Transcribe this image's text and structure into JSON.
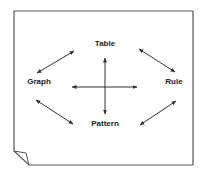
{
  "diagram": {
    "nodes": [
      {
        "id": "table",
        "label": "Table",
        "x": 105,
        "y": 44
      },
      {
        "id": "graph",
        "label": "Graph",
        "x": 39,
        "y": 82
      },
      {
        "id": "rule",
        "label": "Rule",
        "x": 174,
        "y": 82
      },
      {
        "id": "pattern",
        "label": "Pattern",
        "x": 105,
        "y": 124
      }
    ],
    "edges": [
      {
        "from": "graph",
        "to": "table",
        "type": "bidirectional"
      },
      {
        "from": "table",
        "to": "rule",
        "type": "bidirectional"
      },
      {
        "from": "graph",
        "to": "pattern",
        "type": "bidirectional"
      },
      {
        "from": "pattern",
        "to": "rule",
        "type": "bidirectional"
      },
      {
        "from": "table",
        "to": "pattern",
        "type": "bidirectional",
        "note": "vertical center arrow"
      },
      {
        "from": "graph",
        "to": "rule",
        "type": "bidirectional",
        "note": "horizontal center arrow"
      }
    ],
    "frame": {
      "style": "page-with-folded-corner",
      "fold_corner": "bottom-left"
    },
    "colors": {
      "stroke": "#333333",
      "text": "#222222",
      "background": "#ffffff"
    }
  }
}
